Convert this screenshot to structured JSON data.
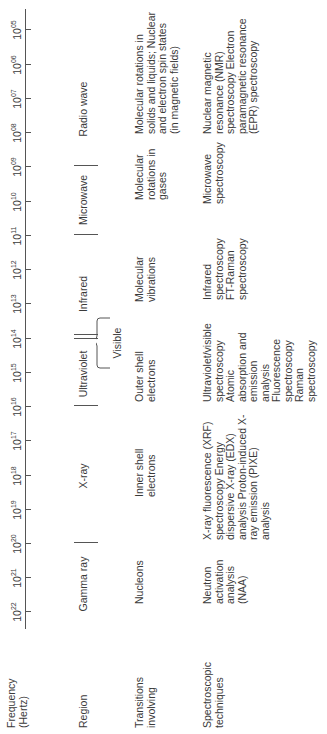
{
  "row_labels": {
    "frequency": "Frequency (Hertz)",
    "region": "Region",
    "transitions": "Transitions involving",
    "techniques": "Spectroscopic techniques"
  },
  "axis": {
    "base": "10",
    "ticks": [
      {
        "exp": "22",
        "x": 122
      },
      {
        "exp": "21",
        "x": 156
      },
      {
        "exp": "20",
        "x": 190
      },
      {
        "exp": "19",
        "x": 224
      },
      {
        "exp": "18",
        "x": 258
      },
      {
        "exp": "17",
        "x": 293
      },
      {
        "exp": "16",
        "x": 327
      },
      {
        "exp": "15",
        "x": 361
      },
      {
        "exp": "14",
        "x": 395
      },
      {
        "exp": "13",
        "x": 430
      },
      {
        "exp": "12",
        "x": 464
      },
      {
        "exp": "11",
        "x": 498
      },
      {
        "exp": "10",
        "x": 532
      },
      {
        "exp": "09",
        "x": 567
      },
      {
        "exp": "08",
        "x": 601
      },
      {
        "exp": "07",
        "x": 635
      },
      {
        "exp": "06",
        "x": 669
      },
      {
        "exp": "05",
        "x": 704
      }
    ]
  },
  "regions": [
    {
      "name": "Gamma ray",
      "center": 150
    },
    {
      "name": "X-ray",
      "center": 258
    },
    {
      "name": "Ultraviolet",
      "center": 360
    },
    {
      "name": "Visible",
      "center": 391
    },
    {
      "name": "Infrared",
      "center": 440
    },
    {
      "name": "Microwave",
      "center": 534
    },
    {
      "name": "Radio wave",
      "center": 625
    }
  ],
  "transitions": [
    {
      "text": "Nucleons",
      "x": 130,
      "w": 60
    },
    {
      "text": "Inner shell electrons",
      "x": 237,
      "w": 62
    },
    {
      "text": "Outer shell electrons",
      "x": 332,
      "w": 62
    },
    {
      "text": "Molecular vibrations",
      "x": 432,
      "w": 62
    },
    {
      "text": "Molecular rotations in gases",
      "x": 534,
      "w": 60
    },
    {
      "text": "Molecular rotations in solids and liquids; Nuclear and electron spin states (in magnetic fields)",
      "x": 600,
      "w": 125
    }
  ],
  "techniques": [
    {
      "text": "Neutron activation analysis (NAA)",
      "x": 130,
      "w": 58
    },
    {
      "text": "X-ray fluorescence (XRF) spectroscopy Energy dispersive X-ray (EDX) analysis Proton-induced X-ray emission (PIXE) analysis",
      "x": 194,
      "w": 128
    },
    {
      "text": "Ultraviolet/visible spectroscopy Atomic absorption and emission analysis Fluorescence spectroscopy Raman spectroscopy",
      "x": 332,
      "w": 80
    },
    {
      "text": "Infrared spectroscopy FT-Raman spectroscopy",
      "x": 434,
      "w": 62
    },
    {
      "text": "Microwave spectroscopy",
      "x": 530,
      "w": 64
    },
    {
      "text": "Nuclear magnetic resonance (NMR) spectroscopy Electron paramagnetic resonance (EPR) spectroscopy",
      "x": 600,
      "w": 132
    }
  ]
}
